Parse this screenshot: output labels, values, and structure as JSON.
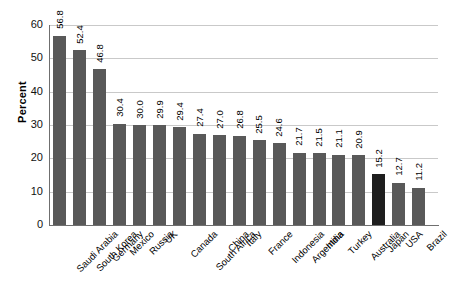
{
  "chart_data": {
    "type": "bar",
    "title": "",
    "subtitle": "",
    "xlabel": "",
    "ylabel": "Percent",
    "ylim": [
      0,
      60
    ],
    "yticks": [
      0,
      10,
      20,
      30,
      40,
      50,
      60
    ],
    "ytick_labels": [
      "0",
      "10",
      "20",
      "30",
      "40",
      "50",
      "60"
    ],
    "grid": "horizontal",
    "legend": "none",
    "bar_color": "#595959",
    "highlight_color": "#1e1e1e",
    "highlight_categories": [
      "Japan"
    ],
    "categories": [
      "Saudi Arabia",
      "South Korea",
      "Germany",
      "Mexico",
      "Russia",
      "UK",
      "Canada",
      "South Africa",
      "China",
      "Italy",
      "France",
      "Indonesia",
      "Argentina",
      "India",
      "Turkey",
      "Australia",
      "Japan",
      "USA",
      "Brazil"
    ],
    "values": [
      56.8,
      52.4,
      46.8,
      30.4,
      30.0,
      29.9,
      29.4,
      27.4,
      27.0,
      26.8,
      25.5,
      24.6,
      21.7,
      21.5,
      21.1,
      20.9,
      15.2,
      12.7,
      11.2
    ],
    "value_labels": [
      "56.8",
      "52.4",
      "46.8",
      "30.4",
      "30.0",
      "29.9",
      "29.4",
      "27.4",
      "27.0",
      "26.8",
      "25.5",
      "24.6",
      "21.7",
      "21.5",
      "21.1",
      "20.9",
      "15.2",
      "12.7",
      "11.2"
    ]
  }
}
